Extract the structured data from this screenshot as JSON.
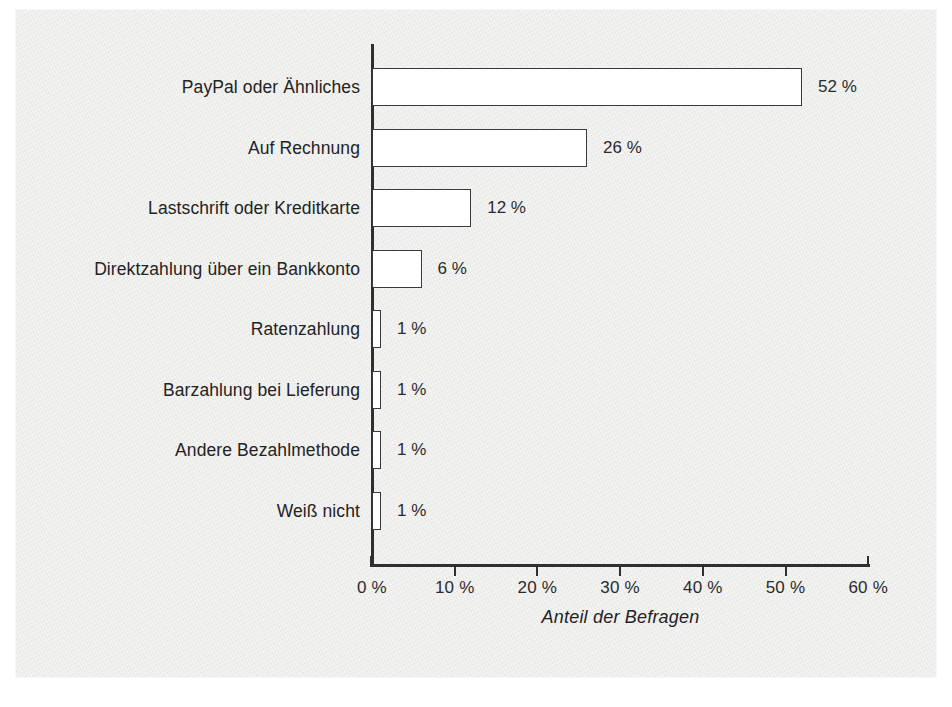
{
  "chart_data": {
    "type": "bar",
    "orientation": "horizontal",
    "title": "",
    "xlabel": "Anteil der Befragen",
    "ylabel": "",
    "xlim": [
      0,
      60
    ],
    "grid": false,
    "legend": null,
    "categories": [
      "PayPal oder Ähnliches",
      "Auf Rechnung",
      "Lastschrift oder Kreditkarte",
      "Direktzahlung über ein Bankkonto",
      "Ratenzahlung",
      "Barzahlung bei Lieferung",
      "Andere Bezahlmethode",
      "Weiß nicht"
    ],
    "values": [
      52,
      26,
      12,
      6,
      1,
      1,
      1,
      1
    ],
    "value_labels": [
      "52 %",
      "26 %",
      "12 %",
      "6 %",
      "1 %",
      "1 %",
      "1 %",
      "1 %"
    ],
    "xticks": [
      0,
      10,
      20,
      30,
      40,
      50,
      60
    ],
    "xtick_labels": [
      "0 %",
      "10 %",
      "20 %",
      "30 %",
      "40 %",
      "50 %",
      "60 %"
    ],
    "colors": {
      "bar_fill": "#ffffff",
      "bar_stroke": "#3a3a3a",
      "axis": "#2f2f2f",
      "text": "#232323",
      "background": "#f3f3f2"
    }
  }
}
